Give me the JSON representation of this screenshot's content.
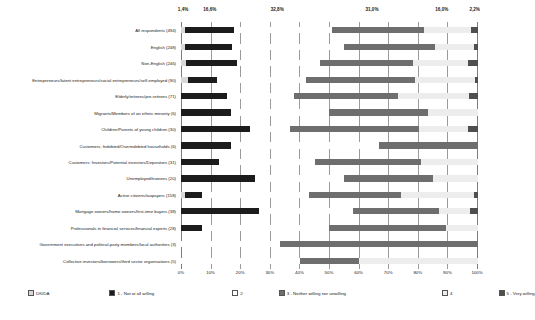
{
  "chart_data": {
    "type": "bar",
    "orientation": "horizontal",
    "stacked": true,
    "normalized": "100%",
    "title": "",
    "xlabel": "",
    "ylabel": "",
    "xlim": [
      0,
      100
    ],
    "grid": true,
    "legend_position": "bottom",
    "xticks": [
      "0%",
      "10%",
      "20%",
      "30%",
      "40%",
      "50%",
      "60%",
      "70%",
      "80%",
      "90%",
      "100%"
    ],
    "xtick_values": [
      0,
      10,
      20,
      30,
      40,
      50,
      60,
      70,
      80,
      90,
      100
    ],
    "top_annotations": {
      "note": "percentage labels printed above the chart for the All respondents bar",
      "labels": [
        "1,4%",
        "16,6%",
        "32,8%",
        "31,0%",
        "16,0%",
        "2,2%"
      ],
      "values": [
        1.4,
        16.6,
        32.8,
        31.0,
        16.0,
        2.2
      ],
      "positions": [
        0.7,
        9.7,
        32.4,
        64.3,
        87.8,
        98.9
      ]
    },
    "legend": [
      {
        "label": "DK/DA",
        "color": "#d8d8d8"
      },
      {
        "label": "1 - Not at all willing",
        "color": "#1c1c1c"
      },
      {
        "label": "2",
        "color": "#ffffff"
      },
      {
        "label": "3 - Neither willing nor unwilling",
        "color": "#6e6e6e"
      },
      {
        "label": "4",
        "color": "#ededed"
      },
      {
        "label": "5 - Very willing",
        "color": "#4f4f4f"
      }
    ],
    "series": [
      {
        "name": "DK/DA",
        "color": "#d8d8d8"
      },
      {
        "name": "1 - Not at all willing",
        "color": "#1c1c1c"
      },
      {
        "name": "2",
        "color": "#ffffff"
      },
      {
        "name": "3 - Neither willing nor unwilling",
        "color": "#6e6e6e"
      },
      {
        "name": "4",
        "color": "#ededed"
      },
      {
        "name": "5 - Very willing",
        "color": "#4f4f4f"
      }
    ],
    "categories": [
      "All respondents (494)",
      "English (248)",
      "Non-English (246)",
      "Entrepreneurs/latent entrepreneurs/social entrepreneurs/self-employed (90)",
      "Elderly/retirees/pre-retirees (71)",
      "Migrants/Members of an ethnic minority (6)",
      "Children/Parents of young children (30)",
      "Customers; Indebted/Overindebted households (6)",
      "Customers: Investors/Potential investors/Depositors (31)",
      "Unemployed/trainees (20)",
      "Active citizens/taxpayers (158)",
      "Mortgage owners/home owners/first-time buyers (38)",
      "Professionals in financial services/financial experts (28)",
      "Government executives and political-party members/local authorities (3)",
      "Collective investors/borrowers/third sector organisations (5)"
    ],
    "rows": [
      {
        "category": "All respondents (494)",
        "values": [
          1.4,
          16.6,
          32.8,
          31.0,
          16.0,
          2.2
        ]
      },
      {
        "category": "English (248)",
        "values": [
          1.2,
          16.1,
          37.5,
          30.6,
          13.3,
          1.3
        ]
      },
      {
        "category": "Non-English (246)",
        "values": [
          1.6,
          17.1,
          28.0,
          31.3,
          18.7,
          3.3
        ]
      },
      {
        "category": "Entrepreneurs/latent entrepreneurs/social entrepreneurs/self-employed (90)",
        "values": [
          2.2,
          10.0,
          30.0,
          36.7,
          20.0,
          1.1
        ]
      },
      {
        "category": "Elderly/retirees/pre-retirees (71)",
        "values": [
          0.0,
          15.5,
          22.5,
          35.2,
          23.9,
          2.9
        ]
      },
      {
        "category": "Migrants/Members of an ethnic minority (6)",
        "values": [
          0.0,
          16.7,
          33.3,
          33.3,
          16.7,
          0.0
        ]
      },
      {
        "category": "Children/Parents of young children (30)",
        "values": [
          0.0,
          23.3,
          13.3,
          43.4,
          16.7,
          3.3
        ]
      },
      {
        "category": "Customers; Indebted/Overindebted households (6)",
        "values": [
          0.0,
          16.7,
          50.0,
          33.3,
          0.0,
          0.0
        ]
      },
      {
        "category": "Customers: Investors/Potential investors/Depositors (31)",
        "values": [
          0.0,
          12.9,
          32.3,
          35.5,
          19.3,
          0.0
        ]
      },
      {
        "category": "Unemployed/trainees (20)",
        "values": [
          0.0,
          25.0,
          30.0,
          30.0,
          15.0,
          0.0
        ]
      },
      {
        "category": "Active citizens/taxpayers (158)",
        "values": [
          1.3,
          5.7,
          36.0,
          31.0,
          24.7,
          1.3
        ]
      },
      {
        "category": "Mortgage owners/home owners/first-time buyers (38)",
        "values": [
          0.0,
          26.3,
          31.6,
          28.9,
          10.5,
          2.7
        ]
      },
      {
        "category": "Professionals in financial services/financial experts (28)",
        "values": [
          0.0,
          7.1,
          42.9,
          39.3,
          10.7,
          0.0
        ]
      },
      {
        "category": "Government executives and political-party members/local authorities (3)",
        "values": [
          0.0,
          0.0,
          33.3,
          66.7,
          0.0,
          0.0
        ]
      },
      {
        "category": "Collective investors/borrowers/third sector organisations (5)",
        "values": [
          0.0,
          0.0,
          40.0,
          20.0,
          40.0,
          0.0
        ]
      }
    ]
  }
}
